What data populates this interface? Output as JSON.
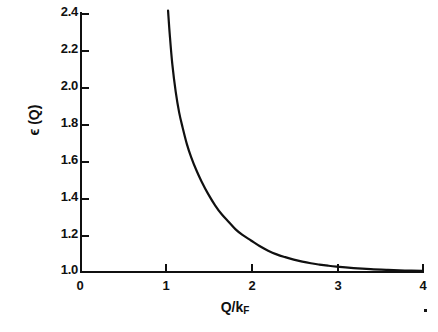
{
  "chart_data": {
    "type": "line",
    "title": "",
    "xlabel": "Q/k_F",
    "xlabel_main": "Q/k",
    "xlabel_sub": "F",
    "ylabel": "ϵ (Q)",
    "xlim": [
      0,
      4
    ],
    "ylim": [
      1.0,
      2.4
    ],
    "xticks": [
      0,
      1,
      2,
      3,
      4
    ],
    "xtick_labels": [
      "0",
      "1",
      "2",
      "3",
      "4"
    ],
    "yticks": [
      1.0,
      1.2,
      1.4,
      1.6,
      1.8,
      2.0,
      2.2,
      2.4
    ],
    "ytick_labels": [
      "1.0",
      "1.2",
      "1.4",
      "1.6",
      "1.8",
      "2.0",
      "2.2",
      "2.4"
    ],
    "grid": false,
    "legend": null,
    "line_color": "#101010",
    "line_width": 2.2,
    "series": [
      {
        "name": "dielectric-function",
        "x": [
          1.03,
          1.05,
          1.08,
          1.12,
          1.16,
          1.2,
          1.25,
          1.3,
          1.36,
          1.42,
          1.5,
          1.58,
          1.66,
          1.74,
          1.82,
          1.9,
          2.0,
          2.1,
          2.2,
          2.3,
          2.4,
          2.5,
          2.6,
          2.7,
          2.8,
          2.9,
          3.0,
          3.2,
          3.4,
          3.6,
          3.8,
          4.0
        ],
        "y": [
          2.41,
          2.28,
          2.12,
          1.97,
          1.86,
          1.78,
          1.69,
          1.62,
          1.55,
          1.49,
          1.42,
          1.36,
          1.31,
          1.27,
          1.23,
          1.2,
          1.17,
          1.14,
          1.115,
          1.095,
          1.08,
          1.067,
          1.056,
          1.047,
          1.04,
          1.034,
          1.029,
          1.021,
          1.015,
          1.011,
          1.008,
          1.006
        ]
      }
    ]
  },
  "figure": {
    "speck_name": "print-speck"
  }
}
